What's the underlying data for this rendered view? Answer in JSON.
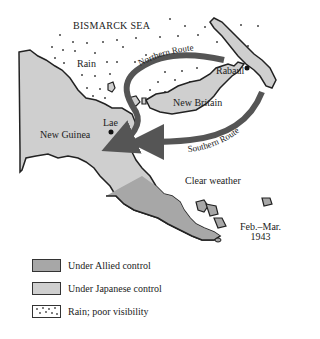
{
  "map": {
    "date_label_line1": "Feb.–Mar.",
    "date_label_line2": "1943",
    "labels": {
      "sea": "BISMARCK SEA",
      "rain": "Rain",
      "rabaul": "Rabaul",
      "new_britain": "New Britain",
      "lae": "Lae",
      "new_guinea": "New Guinea",
      "clear_weather": "Clear weather"
    },
    "routes": {
      "northern": "Northern Route",
      "southern": "Southern Route"
    },
    "colors": {
      "allied": "#a7a7a7",
      "japanese": "#cfcfcf",
      "route": "#555555",
      "outline": "#222222"
    }
  },
  "legend": {
    "items": [
      {
        "label": "Under Allied control",
        "swatch": "allied"
      },
      {
        "label": "Under Japanese control",
        "swatch": "japanese"
      },
      {
        "label": "Rain; poor visibility",
        "swatch": "rain"
      }
    ]
  }
}
